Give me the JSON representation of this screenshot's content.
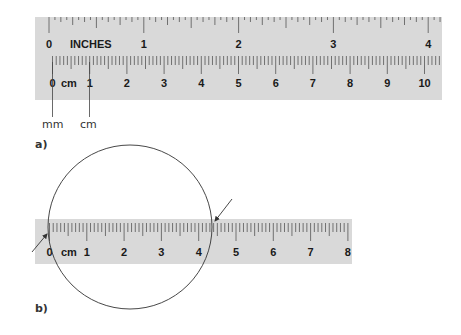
{
  "figure": {
    "panel_a": {
      "label": "a)",
      "ruler": {
        "inch_label": "INCHES",
        "inch_numbers": [
          "0",
          "1",
          "2",
          "3",
          "4"
        ],
        "cm_label": "cm",
        "cm_numbers": [
          "0",
          "1",
          "2",
          "3",
          "4",
          "5",
          "6",
          "7",
          "8",
          "9",
          "10"
        ]
      },
      "callouts": {
        "mm": "mm",
        "cm": "cm"
      }
    },
    "panel_b": {
      "label": "b)",
      "ruler": {
        "cm_label": "cm",
        "cm_numbers": [
          "0",
          "1",
          "2",
          "3",
          "4",
          "5",
          "6",
          "7",
          "8"
        ]
      },
      "annotation": "circle with diameter indicated by two arrows at ~0 cm and ~4.4 cm"
    },
    "colors": {
      "ruler_fill": "#d9d9d9",
      "tick": "#555555",
      "line": "#444444"
    }
  }
}
